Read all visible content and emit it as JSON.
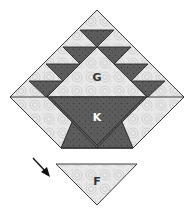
{
  "diagram": {
    "labels": {
      "g": "G",
      "k": "K",
      "f": "F"
    },
    "colors": {
      "light_fabric": "#e6e6e6",
      "light_swirl": "#c4c4c4",
      "dark_fabric": "#5a5a5a",
      "dark_dot": "#3a3a3a",
      "outline": "#2a2a2a",
      "label_dark": "#333333",
      "label_light": "#ffffff",
      "arrow": "#111111"
    },
    "pieces": [
      {
        "id": "top-corner",
        "shade": "light"
      },
      {
        "id": "dark-row1",
        "shade": "dark"
      },
      {
        "id": "dark-row2-left",
        "shade": "dark"
      },
      {
        "id": "dark-row2-right",
        "shade": "dark"
      },
      {
        "id": "dark-row3-left",
        "shade": "dark"
      },
      {
        "id": "dark-row3-right",
        "shade": "dark"
      },
      {
        "id": "dark-row4-left",
        "shade": "dark"
      },
      {
        "id": "dark-row4-right",
        "shade": "dark"
      },
      {
        "id": "G",
        "shade": "light"
      },
      {
        "id": "K",
        "shade": "dark"
      },
      {
        "id": "left-strip",
        "shade": "light"
      },
      {
        "id": "right-strip",
        "shade": "light"
      },
      {
        "id": "F",
        "shade": "light",
        "detached": true
      }
    ],
    "arrow": {
      "direction": "down-right",
      "points_to": "F"
    }
  }
}
